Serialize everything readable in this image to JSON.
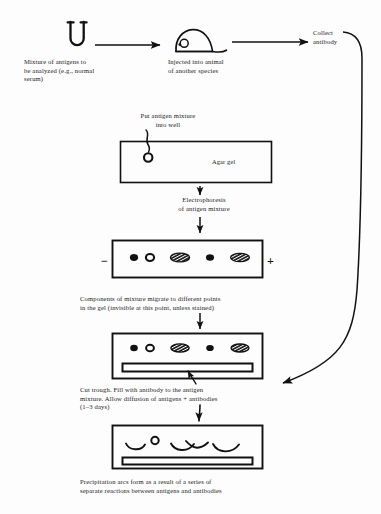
{
  "figure": {
    "ink_color": "#111111",
    "background_color": "#fdfdfd"
  },
  "steps": {
    "mixture_caption": "Mixture of antigens to\nbe analyzed (e.g., normal\nserum)",
    "injected_caption": "Injected into animal\nof another species",
    "collect_caption": "Collect\nantibody",
    "put_well_caption": "Put antigen mixture\ninto well",
    "agar_gel_label": "Agar gel",
    "electrophoresis_caption": "Electrophoresis\nof antigen mixture",
    "components_caption": "Components of mixture migrate to different points\nin the gel (invisible at this point, unless stained)",
    "cut_trough_caption": "Cut trough.  Fill with antibody to the antigen\nmixture.  Allow diffusion of antigens + antibodies\n(1–3 days)",
    "precipitation_caption": "Precipitation arcs form as a result of a series of\nseparate reactions between antigens and antibodies"
  },
  "electrodes": {
    "negative": "−",
    "positive": "+"
  },
  "icons": {
    "test_tube": "test-tube-icon",
    "mouse": "mouse-icon",
    "well": "gel-well-icon",
    "arrow_right": "arrow-right-icon",
    "arrow_down": "arrow-down-icon",
    "arrow_curved": "curved-arrow-icon"
  },
  "gel_panels": [
    {
      "name": "agar-gel-with-well",
      "bands": [],
      "has_well": true,
      "has_trough": false
    },
    {
      "name": "electrophoresis-gel",
      "bands": [
        "filled-small",
        "hollow",
        "striped-oval",
        "filled-small",
        "striped-oval"
      ],
      "has_well": false,
      "has_trough": false
    },
    {
      "name": "gel-with-cut-trough",
      "bands": [
        "filled-small",
        "hollow",
        "striped-oval",
        "filled-small",
        "striped-oval"
      ],
      "has_well": false,
      "has_trough": true
    },
    {
      "name": "gel-with-precipitation-arcs",
      "bands": [
        "hollow"
      ],
      "arcs": 4,
      "has_well": false,
      "has_trough": true
    }
  ]
}
